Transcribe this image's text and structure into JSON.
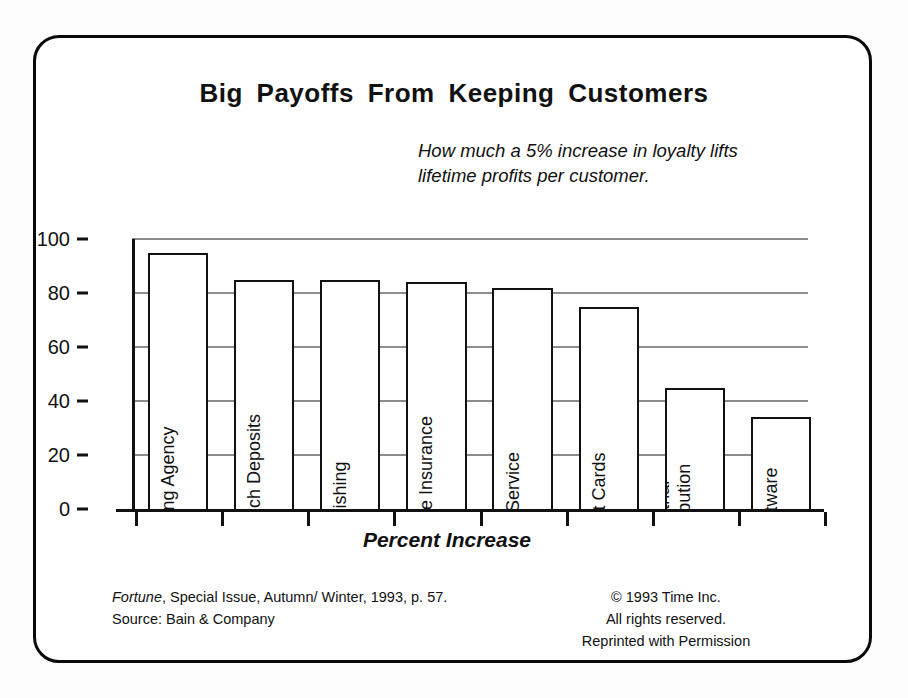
{
  "chart_data": {
    "type": "bar",
    "title": "Big Payoffs From Keeping Customers",
    "subtitle_line1": "How much a 5% increase in loyalty lifts",
    "subtitle_line2": "lifetime profits per customer.",
    "categories": [
      "Advertising Agency",
      "Bank Branch Deposits",
      "Publishing",
      "Auto/Home Insurance",
      "Auto Service",
      "Credit Cards",
      "Industrial Distribution",
      "Software"
    ],
    "values": [
      95,
      85,
      85,
      84,
      82,
      75,
      45,
      34
    ],
    "xlabel": "Percent Increase",
    "ylabel": "",
    "ylim": [
      0,
      100
    ],
    "yticks": [
      0,
      20,
      40,
      60,
      80,
      100
    ],
    "ytick_labels": [
      "0",
      "20",
      "40",
      "60",
      "80",
      "100"
    ],
    "grid": true,
    "legend": "none",
    "orientation": "vertical",
    "bar_fill": "#ffffff",
    "bar_outline": "#111111",
    "gridline_color": "#8d8d8d"
  },
  "footer": {
    "source_publication": "Fortune",
    "source_rest": ", Special Issue, Autumn/ Winter, 1993, p. 57.",
    "source_credit": "Source:  Bain & Company",
    "copyright": "© 1993 Time Inc.",
    "rights": "All rights reserved.",
    "permission": "Reprinted with Permission"
  }
}
